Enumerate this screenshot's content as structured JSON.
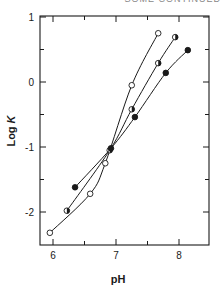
{
  "header": {
    "cropped_text": "SOME CONTINUED"
  },
  "chart_data": {
    "type": "line",
    "title": "",
    "xlabel": "pH",
    "ylabel": "Log K",
    "xlim": [
      5.8,
      8.5
    ],
    "ylim": [
      -2.5,
      1
    ],
    "xticks": [
      6,
      7,
      8
    ],
    "xminor": [
      6.5,
      7.5
    ],
    "yticks": [
      1,
      0,
      -1,
      -2
    ],
    "yminor": [
      0.5,
      -0.5,
      -1.5
    ],
    "ytick_labels": [
      "1",
      "0",
      "-1",
      "-2"
    ],
    "xtick_labels": [
      "6",
      "7",
      "8"
    ],
    "grid": false,
    "legend": null,
    "series": [
      {
        "name": "open circles",
        "marker": "open",
        "x": [
          5.95,
          6.59,
          6.83,
          7.25,
          7.67
        ],
        "y": [
          -2.32,
          -1.72,
          -1.25,
          -0.05,
          0.75
        ]
      },
      {
        "name": "half-filled circles",
        "marker": "half",
        "x": [
          6.22,
          6.9,
          7.25,
          7.67,
          7.94
        ],
        "y": [
          -1.98,
          -1.05,
          -0.42,
          0.29,
          0.69
        ]
      },
      {
        "name": "filled circles",
        "marker": "filled",
        "x": [
          6.35,
          6.92,
          7.3,
          7.79,
          8.14
        ],
        "y": [
          -1.62,
          -1.02,
          -0.54,
          0.14,
          0.49
        ]
      }
    ]
  },
  "colors": {
    "ink": "#1a1a1a",
    "background": "#ffffff"
  }
}
